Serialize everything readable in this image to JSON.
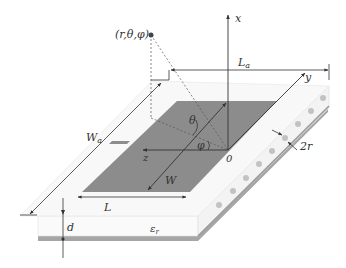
{
  "colors": {
    "background": "#ffffff",
    "patch": "#8c8c8c",
    "ground": "#a6a6a6",
    "substrate_top": "#f7f7f7",
    "substrate_side": "#f2f2f2",
    "vias": "#bdbdbd",
    "lines": "#333333",
    "dashed": "#555555"
  },
  "labels": {
    "point": "(r,θ,φ)",
    "axis_x": "x",
    "axis_y": "y",
    "axis_z": "z",
    "origin": "0",
    "theta": "θ",
    "phi": "φ",
    "La": "L",
    "La_sub": "a",
    "Wa": "W",
    "Wa_sub": "a",
    "W": "W",
    "L": "L",
    "d": "d",
    "eps": "ε",
    "eps_sub": "r",
    "via_diameter": "2r"
  },
  "vias": {
    "count": 9
  }
}
